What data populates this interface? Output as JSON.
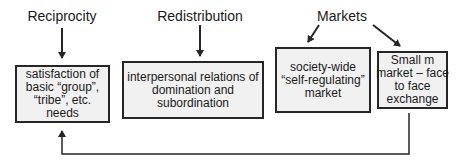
{
  "diagram": {
    "categories": [
      {
        "id": "reciprocity",
        "label": "Reciprocity"
      },
      {
        "id": "redistribution",
        "label": "Redistribution"
      },
      {
        "id": "markets",
        "label": "Markets"
      }
    ],
    "boxes": [
      {
        "id": "basic-needs",
        "text": "satisfaction of basic “group”, “tribe”, etc. needs",
        "lines": [
          "satisfaction of",
          "basic “group”,",
          "“tribe”, etc.",
          "needs"
        ]
      },
      {
        "id": "domination",
        "text": "interpersonal relations of domination and subordination",
        "lines": [
          "interpersonal relations of",
          "domination and",
          "subordination"
        ]
      },
      {
        "id": "self-regulating-market",
        "text": "society-wide “self-regulating” market",
        "lines": [
          "society-wide",
          "“self-regulating”",
          "market"
        ]
      },
      {
        "id": "small-m-market",
        "text": "Small m market – face to face exchange",
        "lines": [
          "Small m",
          "market – face",
          "to face",
          "exchange"
        ]
      }
    ],
    "connections": [
      {
        "from": "Reciprocity",
        "to": "basic-needs"
      },
      {
        "from": "Redistribution",
        "to": "domination"
      },
      {
        "from": "Markets",
        "to": "self-regulating-market"
      },
      {
        "from": "Markets",
        "to": "small-m-market"
      },
      {
        "from": "small-m-market",
        "to": "basic-needs",
        "style": "elbow-feedback"
      }
    ],
    "colors": {
      "stroke": "#262626",
      "box_fill": "#f1f1f1",
      "background": "#ffffff"
    }
  }
}
